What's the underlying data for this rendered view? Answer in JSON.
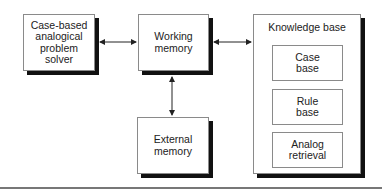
{
  "diagram": {
    "nodes": {
      "solver": {
        "label": "Case-based\nanalogical\nproblem\nsolver"
      },
      "working_memory": {
        "label": "Working\nmemory"
      },
      "external_memory": {
        "label": "External\nmemory"
      },
      "knowledge_base": {
        "label": "Knowledge base",
        "components": [
          {
            "label": "Case\nbase"
          },
          {
            "label": "Rule\nbase"
          },
          {
            "label": "Analog\nretrieval"
          }
        ]
      }
    },
    "edges": [
      {
        "from": "solver",
        "to": "working_memory",
        "direction": "bidirectional"
      },
      {
        "from": "working_memory",
        "to": "knowledge_base",
        "direction": "bidirectional"
      },
      {
        "from": "working_memory",
        "to": "external_memory",
        "direction": "bidirectional"
      }
    ]
  }
}
